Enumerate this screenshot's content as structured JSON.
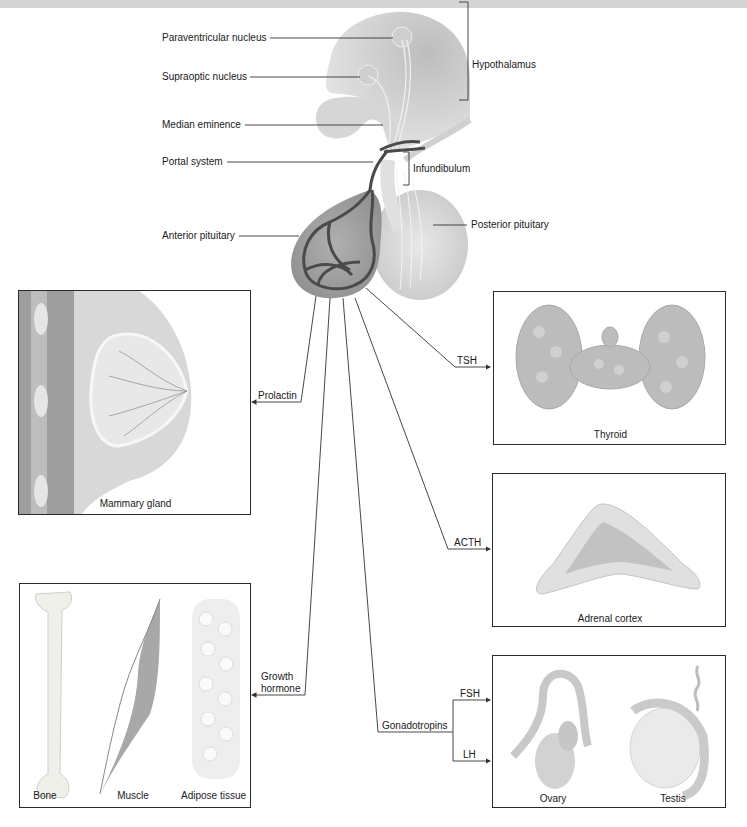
{
  "anatomy_labels": {
    "paraventricular": "Paraventricular nucleus",
    "supraoptic": "Supraoptic nucleus",
    "median_eminence": "Median eminence",
    "portal_system": "Portal system",
    "anterior_pituitary": "Anterior pituitary",
    "hypothalamus": "Hypothalamus",
    "infundibulum": "Infundibulum",
    "posterior_pituitary": "Posterior pituitary"
  },
  "hormones": {
    "prolactin": "Prolactin",
    "tsh": "TSH",
    "acth": "ACTH",
    "growth_hormone_line1": "Growth",
    "growth_hormone_line2": "hormone",
    "gonadotropins": "Gonadotropins",
    "fsh": "FSH",
    "lh": "LH"
  },
  "targets": {
    "mammary": "Mammary gland",
    "thyroid": "Thyroid",
    "adrenal": "Adrenal cortex",
    "bone": "Bone",
    "muscle": "Muscle",
    "adipose": "Adipose tissue",
    "ovary": "Ovary",
    "testis": "Testis"
  },
  "colors": {
    "line": "#333333",
    "vessel": "#4a4a4a",
    "tissue_light": "#d9d9d9",
    "tissue_mid": "#b5b5b5",
    "top_band": "#d4d4d4"
  }
}
